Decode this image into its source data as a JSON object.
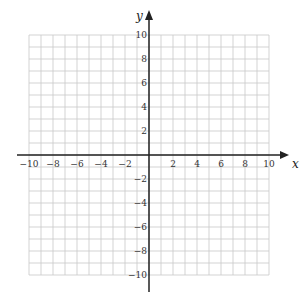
{
  "chart_data": {
    "type": "scatter",
    "title": "",
    "xlabel": "x",
    "ylabel": "y",
    "xlim": [
      -10,
      10
    ],
    "ylim": [
      -10,
      10
    ],
    "grid": true,
    "grid_step": 1,
    "x_ticks": [
      -10,
      -8,
      -6,
      -4,
      -2,
      2,
      4,
      6,
      8,
      10
    ],
    "y_ticks": [
      10,
      8,
      6,
      4,
      2,
      -2,
      -4,
      -6,
      -8,
      -10
    ],
    "x_tick_labels": [
      "−10",
      "−8",
      "−6",
      "−4",
      "−2",
      "2",
      "4",
      "6",
      "8",
      "10"
    ],
    "y_tick_labels": [
      "10",
      "8",
      "6",
      "4",
      "2",
      "−2",
      "−4",
      "−6",
      "−8",
      "−10"
    ],
    "series": [],
    "legend": null
  },
  "colors": {
    "grid": "#c8c8c8",
    "axis": "#222222",
    "background": "#ffffff"
  },
  "layout": {
    "origin_px": [
      149,
      155
    ],
    "unit_px": 12,
    "grid_left_px": 29,
    "grid_top_px": 35
  }
}
